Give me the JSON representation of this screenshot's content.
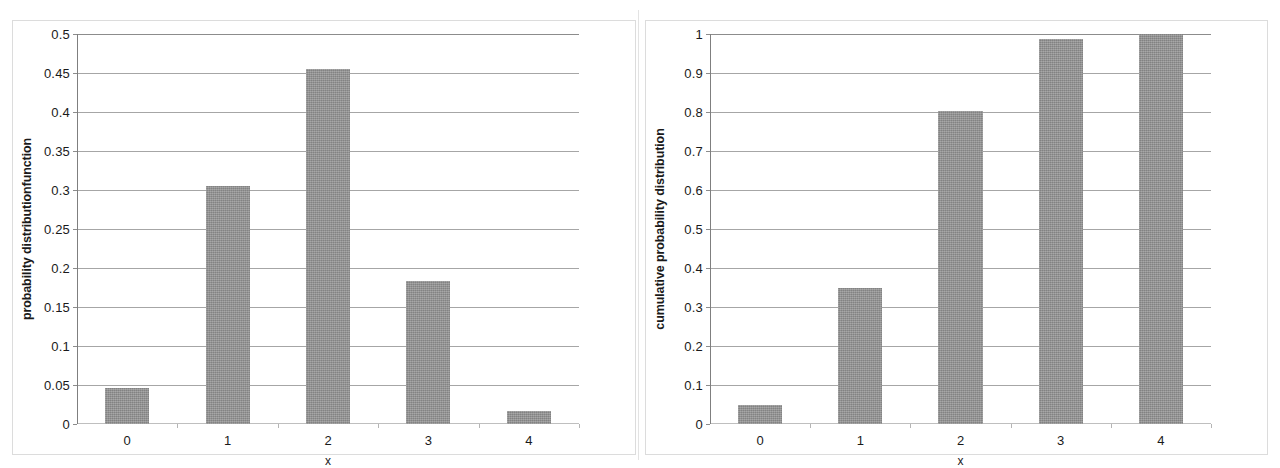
{
  "figure": {
    "background_color": "#ffffff",
    "bar_color": "#959595",
    "gridline_color": "#a6a6a6"
  },
  "chart_data": [
    {
      "id": "pdf",
      "type": "bar",
      "title": "",
      "xlabel": "x",
      "ylabel": "probability distributionfunction",
      "categories": [
        "0",
        "1",
        "2",
        "3",
        "4"
      ],
      "values": [
        0.046,
        0.305,
        0.455,
        0.183,
        0.017
      ],
      "ylim": [
        0,
        0.5
      ],
      "ytick_labels": [
        "0",
        "0.05",
        "0.1",
        "0.15",
        "0.2",
        "0.25",
        "0.3",
        "0.35",
        "0.4",
        "0.45",
        "0.5"
      ],
      "ytick_values": [
        0,
        0.05,
        0.1,
        0.15,
        0.2,
        0.25,
        0.3,
        0.35,
        0.4,
        0.45,
        0.5
      ],
      "grid": true,
      "legend": "none"
    },
    {
      "id": "cdf",
      "type": "bar",
      "title": "",
      "xlabel": "x",
      "ylabel": "cumulative probability distribution",
      "categories": [
        "0",
        "1",
        "2",
        "3",
        "4"
      ],
      "values": [
        0.048,
        0.35,
        0.803,
        0.987,
        1.0
      ],
      "ylim": [
        0,
        1
      ],
      "ytick_labels": [
        "0",
        "0.1",
        "0.2",
        "0.3",
        "0.4",
        "0.5",
        "0.6",
        "0.7",
        "0.8",
        "0.9",
        "1"
      ],
      "ytick_values": [
        0,
        0.1,
        0.2,
        0.3,
        0.4,
        0.5,
        0.6,
        0.7,
        0.8,
        0.9,
        1
      ],
      "grid": true,
      "legend": "none"
    }
  ]
}
